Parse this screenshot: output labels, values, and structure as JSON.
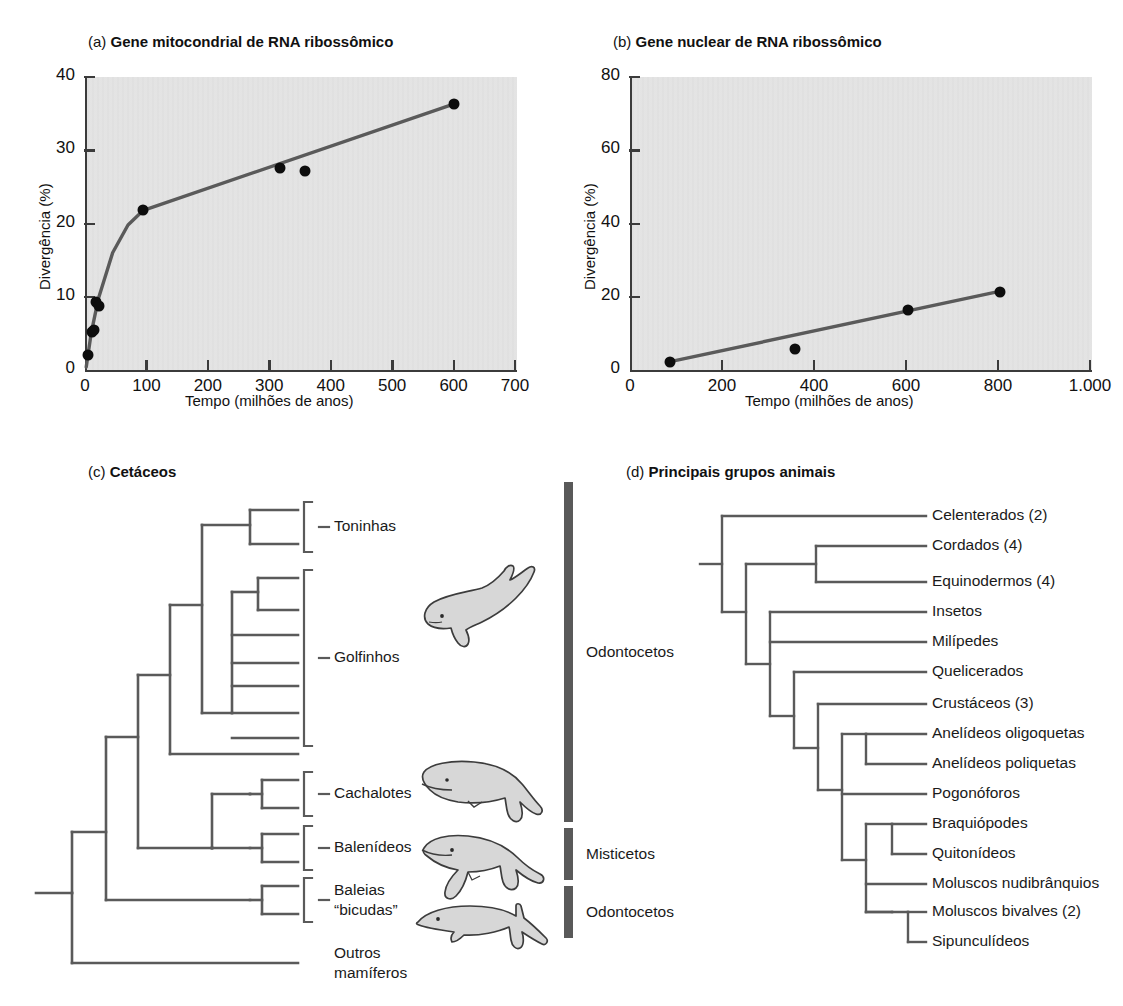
{
  "figure": {
    "panels": [
      {
        "tag": "(a)",
        "title": "Gene mitocondrial de RNA ribossômico"
      },
      {
        "tag": "(b)",
        "title": "Gene nuclear de RNA ribossômico"
      },
      {
        "tag": "(c)",
        "title": "Cetáceos"
      },
      {
        "tag": "(d)",
        "title": "Principais grupos animais"
      }
    ]
  },
  "chart_data": [
    {
      "type": "scatter",
      "panel": "a",
      "title": "Gene mitocondrial de RNA ribossômico",
      "xlabel": "Tempo (milhões de anos)",
      "ylabel": "Divergência (%)",
      "xlim": [
        0,
        700
      ],
      "ylim": [
        0,
        40
      ],
      "xticks": [
        0,
        100,
        200,
        300,
        400,
        500,
        600,
        700
      ],
      "xtick_labels": [
        "0",
        "100",
        "200",
        "300",
        "400",
        "500",
        "600",
        "700"
      ],
      "yticks": [
        0,
        10,
        20,
        30,
        40
      ],
      "ytick_labels": [
        "0",
        "10",
        "20",
        "30",
        "40"
      ],
      "grid": false,
      "legend": "none",
      "plot_bg": "#e3e3e3",
      "line_color": "#5a5a5a",
      "marker_color": "#0d0d0d",
      "points": [
        {
          "x": 5,
          "y": 2.0
        },
        {
          "x": 12,
          "y": 5.2
        },
        {
          "x": 15,
          "y": 5.4
        },
        {
          "x": 18,
          "y": 9.3
        },
        {
          "x": 22,
          "y": 8.8
        },
        {
          "x": 95,
          "y": 21.8
        },
        {
          "x": 318,
          "y": 27.6
        },
        {
          "x": 358,
          "y": 27.1
        },
        {
          "x": 600,
          "y": 36.3
        }
      ],
      "fit_line": [
        {
          "x": 2,
          "y": 0.4
        },
        {
          "x": 10,
          "y": 5.0
        },
        {
          "x": 22,
          "y": 9.8
        },
        {
          "x": 45,
          "y": 16.0
        },
        {
          "x": 70,
          "y": 19.8
        },
        {
          "x": 95,
          "y": 21.8
        },
        {
          "x": 600,
          "y": 36.3
        }
      ]
    },
    {
      "type": "scatter",
      "panel": "b",
      "title": "Gene nuclear de RNA ribossômico",
      "xlabel": "Tempo (milhões de anos)",
      "ylabel": "Divergência (%)",
      "xlim": [
        0,
        1000
      ],
      "ylim": [
        0,
        80
      ],
      "xticks": [
        0,
        200,
        400,
        600,
        800,
        1000
      ],
      "xtick_labels": [
        "0",
        "200",
        "400",
        "600",
        "800",
        "1.000"
      ],
      "yticks": [
        0,
        20,
        40,
        60,
        80
      ],
      "ytick_labels": [
        "0",
        "20",
        "40",
        "60",
        "80"
      ],
      "grid": false,
      "legend": "none",
      "plot_bg": "#e3e3e3",
      "line_color": "#5a5a5a",
      "marker_color": "#0d0d0d",
      "points": [
        {
          "x": 88,
          "y": 2.3
        },
        {
          "x": 358,
          "y": 5.6
        },
        {
          "x": 605,
          "y": 16.3
        },
        {
          "x": 805,
          "y": 21.4
        }
      ],
      "fit_line": [
        {
          "x": 85,
          "y": 2.2
        },
        {
          "x": 808,
          "y": 21.6
        }
      ]
    }
  ],
  "cetaceans": {
    "tips": [
      {
        "label": "Toninhas"
      },
      {
        "label": "Golfinhos"
      },
      {
        "label": "Cachalotes"
      },
      {
        "label": "Balenídeos"
      },
      {
        "label": "Baleias\n“bicudas”"
      },
      {
        "label": "Outros\nmamíferos"
      }
    ],
    "tip_labels": {
      "toninhas": "Toninhas",
      "golfinhos": "Golfinhos",
      "cachalotes": "Cachalotes",
      "balenideos": "Balenídeos",
      "baleias_l1": "Baleias",
      "baleias_l2": "“bicudas”",
      "outros_l1": "Outros",
      "outros_l2": "mamíferos"
    },
    "groups": [
      {
        "label": "Odontocetos"
      },
      {
        "label": "Misticetos"
      },
      {
        "label": "Odontocetos"
      }
    ],
    "group_labels": {
      "odontocetos_top": "Odontocetos",
      "misticetos": "Misticetos",
      "odontocetos_bottom": "Odontocetos"
    },
    "animals": [
      {
        "name": "dolphin-illustration"
      },
      {
        "name": "sperm-whale-illustration"
      },
      {
        "name": "right-whale-illustration"
      },
      {
        "name": "beaked-whale-illustration"
      }
    ],
    "bar_color": "#595959",
    "branch_color": "#5a5a5a"
  },
  "animal_groups": {
    "branch_color": "#5a5a5a",
    "tips": [
      {
        "label": "Celenterados (2)"
      },
      {
        "label": "Cordados (4)"
      },
      {
        "label": "Equinodermos (4)"
      },
      {
        "label": "Insetos"
      },
      {
        "label": "Milípedes"
      },
      {
        "label": "Quelicerados"
      },
      {
        "label": "Crustáceos (3)"
      },
      {
        "label": "Anelídeos oligoquetas"
      },
      {
        "label": "Anelídeos poliquetas"
      },
      {
        "label": "Pogonóforos"
      },
      {
        "label": "Braquiópodes"
      },
      {
        "label": "Quitonídeos"
      },
      {
        "label": "Moluscos nudibrânquios"
      },
      {
        "label": "Moluscos bivalves (2)"
      },
      {
        "label": "Sipunculídeos"
      }
    ]
  }
}
